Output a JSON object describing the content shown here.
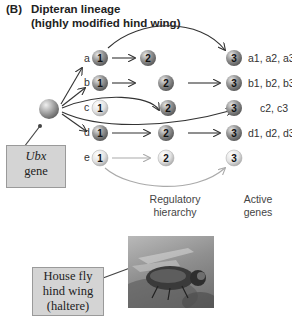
{
  "title": {
    "tag": "(B)",
    "line1": "Dipteran lineage",
    "line2": "(highly modified hind wing)"
  },
  "ubx_box": {
    "line1": "Ubx",
    "line2": "gene"
  },
  "rows": [
    {
      "label": "a",
      "n1": "1",
      "n2": "2",
      "n3": "3",
      "genes": "a1, a2, a3",
      "state": [
        "dark",
        "dark",
        "dark"
      ]
    },
    {
      "label": "b",
      "n1": "1",
      "n2": "2",
      "n3": "3",
      "genes": "b1, b2, b3",
      "state": [
        "dark",
        "dark",
        "dark"
      ]
    },
    {
      "label": "c",
      "n1": "1",
      "n2": "2",
      "n3": "3",
      "genes": "c2, c3",
      "state": [
        "light",
        "dark",
        "dark"
      ]
    },
    {
      "label": "d",
      "n1": "1",
      "n2": "2",
      "n3": "3",
      "genes": "d1, d2, d3",
      "state": [
        "dark",
        "dark",
        "dark"
      ]
    },
    {
      "label": "e",
      "n1": "1",
      "n2": "2",
      "n3": "3",
      "genes": "",
      "state": [
        "light",
        "light",
        "light"
      ]
    }
  ],
  "captions": {
    "regulatory": {
      "line1": "Regulatory",
      "line2": "hierarchy"
    },
    "active": {
      "line1": "Active",
      "line2": "genes"
    }
  },
  "photo_box": {
    "line1": "House fly",
    "line2": "hind wing",
    "line3": "(haltere)"
  },
  "colors": {
    "dark_node": "#8a8a8a",
    "light_node": "#e0e0e0",
    "box_fill": "#d4d4d4",
    "arrow": "#333333",
    "faint_arrow": "#b0b0b0"
  }
}
